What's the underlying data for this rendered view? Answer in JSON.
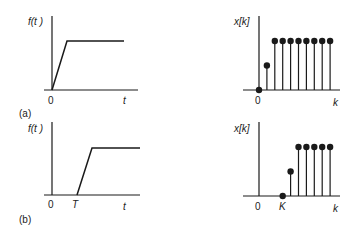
{
  "figure": {
    "panels": [
      {
        "id": "a",
        "caption": "(a)",
        "continuous": {
          "ylabel": "f(t )",
          "xlabel": "t",
          "origin_label": "0",
          "shift_label": "",
          "description": "ramp starting at t=0 rising to a constant plateau"
        },
        "discrete": {
          "ylabel": "x[k]",
          "xlabel": "k",
          "origin_label": "0",
          "shift_label": "",
          "samples": [
            0,
            0.5,
            1,
            1,
            1,
            1,
            1,
            1,
            1,
            1
          ],
          "description": "sampled ramp: x[0]=0, x[1]=0.5, then 8 samples at plateau"
        }
      },
      {
        "id": "b",
        "caption": "(b)",
        "continuous": {
          "ylabel": "f(t )",
          "xlabel": "t",
          "origin_label": "0",
          "shift_label": "T",
          "description": "same ramp delayed by T"
        },
        "discrete": {
          "ylabel": "x[k]",
          "xlabel": "k",
          "origin_label": "0",
          "shift_label": "K",
          "samples_start_index": 3,
          "samples": [
            0,
            0.5,
            1,
            1,
            1,
            1,
            1
          ],
          "description": "sampled ramp delayed by K samples"
        }
      }
    ],
    "colors": {
      "ink": "#1a1a1a",
      "background": "#ffffff"
    }
  }
}
